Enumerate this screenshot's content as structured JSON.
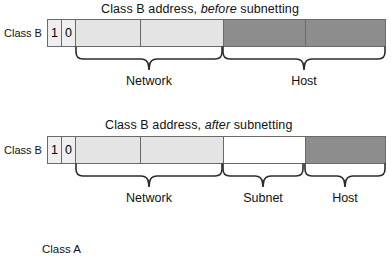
{
  "figure": {
    "footer_label": "Class A"
  },
  "diagrams": [
    {
      "id": "before",
      "title_prefix": "Class B address, ",
      "title_emphasis": "before",
      "title_suffix": " subnetting",
      "row_label": "Class B",
      "bits": [
        "1",
        "0"
      ],
      "fields": [
        {
          "name": "Network",
          "label": "Network",
          "fill": "light"
        },
        {
          "name": "Host",
          "label": "Host",
          "fill": "dark"
        }
      ]
    },
    {
      "id": "after",
      "title_prefix": "Class B address, ",
      "title_emphasis": "after",
      "title_suffix": " subnetting",
      "row_label": "Class B",
      "bits": [
        "1",
        "0"
      ],
      "fields": [
        {
          "name": "Network",
          "label": "Network",
          "fill": "light"
        },
        {
          "name": "Subnet",
          "label": "Subnet",
          "fill": "white"
        },
        {
          "name": "Host",
          "label": "Host",
          "fill": "dark"
        }
      ]
    }
  ],
  "colors": {
    "light_gray": "#e4e4e4",
    "dark_gray": "#8d8d8d",
    "white": "#ffffff",
    "stroke": "#6a6a6a",
    "text": "#111111"
  }
}
